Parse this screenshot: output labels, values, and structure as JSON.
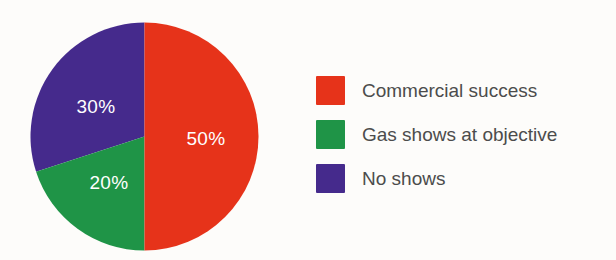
{
  "chart_data": {
    "type": "pie",
    "title": "",
    "subtitle": "",
    "xlabel": "",
    "ylabel": "",
    "grid": false,
    "legend_position": "right",
    "categories": [
      "Commercial success",
      "Gas shows at objective",
      "No shows"
    ],
    "values": [
      50,
      20,
      30
    ],
    "value_unit": "%",
    "data_labels": [
      "50%",
      "20%",
      "30%"
    ],
    "colors": [
      "#E6331A",
      "#1F9447",
      "#452A8C"
    ],
    "start_angle_deg": 0,
    "direction": "clockwise",
    "slices": [
      {
        "label": "Commercial success",
        "value": 50,
        "data_label": "50%",
        "color": "#E6331A",
        "start_deg": 0,
        "end_deg": 180
      },
      {
        "label": "Gas shows at objective",
        "value": 20,
        "data_label": "20%",
        "color": "#1F9447",
        "start_deg": 180,
        "end_deg": 252
      },
      {
        "label": "No shows",
        "value": 30,
        "data_label": "30%",
        "color": "#452A8C",
        "start_deg": 252,
        "end_deg": 360
      }
    ]
  },
  "legend": {
    "items": [
      {
        "label": "Commercial success",
        "color": "#E6331A"
      },
      {
        "label": "Gas shows at objective",
        "color": "#1F9447"
      },
      {
        "label": "No shows",
        "color": "#452A8C"
      }
    ]
  },
  "background_color": "#FDFCFA",
  "label_text_color": "#FFFFFF",
  "legend_text_color": "#4C4C4C"
}
